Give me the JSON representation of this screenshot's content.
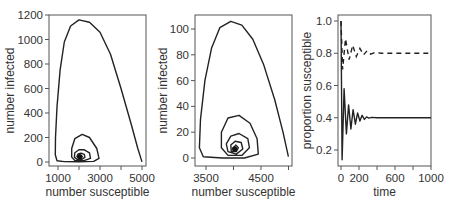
{
  "chart_data": [
    {
      "type": "line",
      "panel": "left",
      "title": "",
      "xlabel": "number susceptible",
      "ylabel": "number infected",
      "xlim": [
        750,
        5100
      ],
      "ylim": [
        -30,
        1200
      ],
      "xticks": [
        1000,
        2000,
        3000,
        4000,
        5000
      ],
      "xtick_labels": [
        "1000",
        "",
        "3000",
        "",
        "5000"
      ],
      "yticks": [
        0,
        200,
        400,
        600,
        800,
        1000,
        1200
      ],
      "ytick_labels": [
        "0",
        "200",
        "400",
        "600",
        "800",
        "1000",
        "1200"
      ],
      "grid": false,
      "description": "Phase-plane spiral of infected vs susceptible converging to equilibrium near (2000, 40)",
      "series": [
        {
          "name": "trajectory",
          "points": [
            [
              4999,
              1
            ],
            [
              4800,
              110
            ],
            [
              4500,
              300
            ],
            [
              4000,
              600
            ],
            [
              3500,
              880
            ],
            [
              3000,
              1060
            ],
            [
              2500,
              1140
            ],
            [
              2000,
              1160
            ],
            [
              1600,
              1110
            ],
            [
              1300,
              980
            ],
            [
              1100,
              750
            ],
            [
              950,
              450
            ],
            [
              880,
              200
            ],
            [
              870,
              60
            ],
            [
              950,
              10
            ],
            [
              1300,
              3
            ],
            [
              2000,
              2
            ],
            [
              2700,
              5
            ],
            [
              2950,
              30
            ],
            [
              2850,
              110
            ],
            [
              2500,
              200
            ],
            [
              2150,
              225
            ],
            [
              1800,
              190
            ],
            [
              1650,
              110
            ],
            [
              1650,
              40
            ],
            [
              1800,
              12
            ],
            [
              2200,
              10
            ],
            [
              2550,
              30
            ],
            [
              2500,
              75
            ],
            [
              2250,
              100
            ],
            [
              2000,
              100
            ],
            [
              1800,
              75
            ],
            [
              1780,
              40
            ],
            [
              1900,
              22
            ],
            [
              2150,
              22
            ],
            [
              2280,
              40
            ],
            [
              2250,
              62
            ],
            [
              2100,
              72
            ],
            [
              1950,
              65
            ],
            [
              1900,
              45
            ],
            [
              1980,
              32
            ],
            [
              2100,
              34
            ],
            [
              2150,
              45
            ],
            [
              2080,
              52
            ],
            [
              2010,
              47
            ],
            [
              2030,
              40
            ],
            [
              2050,
              42
            ],
            [
              2040,
              44
            ]
          ]
        }
      ],
      "equilibrium": [
        2040,
        44
      ]
    },
    {
      "type": "line",
      "panel": "middle",
      "title": "",
      "xlabel": "number susceptible",
      "ylabel": "number infected",
      "xlim": [
        3300,
        5050
      ],
      "ylim": [
        -3,
        110
      ],
      "xticks": [
        3500,
        4000,
        4500,
        5000
      ],
      "xtick_labels": [
        "3500",
        "",
        "4500",
        ""
      ],
      "yticks": [
        0,
        20,
        40,
        60,
        80,
        100
      ],
      "ytick_labels": [
        "0",
        "20",
        "40",
        "60",
        "80",
        "100"
      ],
      "grid": false,
      "description": "Phase-plane spiral of infected vs susceptible converging to equilibrium near (4000, 7)",
      "series": [
        {
          "name": "trajectory",
          "points": [
            [
              4999,
              1
            ],
            [
              4900,
              20
            ],
            [
              4750,
              45
            ],
            [
              4550,
              72
            ],
            [
              4350,
              92
            ],
            [
              4150,
              103
            ],
            [
              3950,
              106
            ],
            [
              3750,
              101
            ],
            [
              3600,
              85
            ],
            [
              3480,
              60
            ],
            [
              3400,
              30
            ],
            [
              3380,
              8
            ],
            [
              3450,
              1
            ],
            [
              3800,
              0
            ],
            [
              4200,
              0
            ],
            [
              4450,
              3
            ],
            [
              4430,
              15
            ],
            [
              4300,
              27
            ],
            [
              4100,
              33
            ],
            [
              3900,
              31
            ],
            [
              3780,
              20
            ],
            [
              3780,
              8
            ],
            [
              3900,
              2
            ],
            [
              4150,
              2
            ],
            [
              4290,
              8
            ],
            [
              4260,
              15
            ],
            [
              4100,
              19
            ],
            [
              3950,
              17
            ],
            [
              3870,
              11
            ],
            [
              3900,
              5
            ],
            [
              4050,
              3
            ],
            [
              4170,
              7
            ],
            [
              4140,
              12
            ],
            [
              4030,
              13
            ],
            [
              3950,
              10
            ],
            [
              3960,
              5
            ],
            [
              4050,
              5
            ],
            [
              4090,
              8
            ],
            [
              4040,
              10
            ],
            [
              4000,
              8
            ],
            [
              4020,
              6
            ],
            [
              4040,
              7
            ],
            [
              4020,
              7
            ]
          ]
        }
      ],
      "equilibrium": [
        4020,
        7
      ]
    },
    {
      "type": "line",
      "panel": "right",
      "title": "",
      "xlabel": "time",
      "ylabel": "proportion susceptible",
      "xlim": [
        -20,
        1000
      ],
      "ylim": [
        0.1,
        1.02
      ],
      "xticks": [
        0,
        200,
        400,
        600,
        800,
        1000
      ],
      "xtick_labels": [
        "0",
        "200",
        "",
        "600",
        "",
        "1000"
      ],
      "yticks": [
        0.2,
        0.4,
        0.6,
        0.8,
        1.0
      ],
      "ytick_labels": [
        "0.2",
        "0.4",
        "0.6",
        "0.8",
        "1.0"
      ],
      "grid": false,
      "series": [
        {
          "name": "solid (damped oscillation to 0.4)",
          "style": "solid",
          "points": [
            [
              0,
              1.0
            ],
            [
              12,
              0.14
            ],
            [
              35,
              0.58
            ],
            [
              60,
              0.3
            ],
            [
              85,
              0.48
            ],
            [
              110,
              0.33
            ],
            [
              135,
              0.45
            ],
            [
              160,
              0.36
            ],
            [
              185,
              0.43
            ],
            [
              210,
              0.38
            ],
            [
              235,
              0.415
            ],
            [
              260,
              0.39
            ],
            [
              285,
              0.405
            ],
            [
              310,
              0.398
            ],
            [
              340,
              0.402
            ],
            [
              400,
              0.4
            ],
            [
              1000,
              0.4
            ]
          ]
        },
        {
          "name": "dashed (damped oscillation to 0.8)",
          "style": "dashed",
          "points": [
            [
              0,
              1.0
            ],
            [
              18,
              0.7
            ],
            [
              50,
              0.89
            ],
            [
              90,
              0.76
            ],
            [
              130,
              0.85
            ],
            [
              170,
              0.78
            ],
            [
              210,
              0.83
            ],
            [
              250,
              0.79
            ],
            [
              290,
              0.815
            ],
            [
              330,
              0.795
            ],
            [
              380,
              0.805
            ],
            [
              450,
              0.8
            ],
            [
              1000,
              0.8
            ]
          ]
        }
      ]
    }
  ]
}
